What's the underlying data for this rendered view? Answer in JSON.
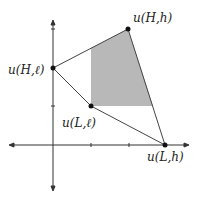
{
  "diagram": {
    "type": "utility-possibility-set",
    "colors": {
      "axis": "#333333",
      "line": "#444444",
      "fill": "#b8b8b8",
      "point": "#111111"
    },
    "axes": {
      "origin": [
        53,
        145
      ],
      "x_range": [
        10,
        188
      ],
      "y_range": [
        21,
        190
      ],
      "x_ticks": [
        91,
        129
      ],
      "y_ticks": [
        29,
        106
      ]
    },
    "points": [
      {
        "id": "HH",
        "label": "u(H,h)",
        "x": 128,
        "y": 29,
        "lx": 133,
        "ly": 22
      },
      {
        "id": "Hl",
        "label": "u(H,ℓ)",
        "x": 53,
        "y": 68,
        "lx": 8,
        "ly": 74
      },
      {
        "id": "Ll",
        "label": "u(L,ℓ)",
        "x": 91,
        "y": 106,
        "lx": 62,
        "ly": 127
      },
      {
        "id": "Lh",
        "label": "u(L,h)",
        "x": 165,
        "y": 145,
        "lx": 147,
        "ly": 161
      }
    ],
    "shaded_region": "91,48 128,29 153,106 91,106"
  }
}
